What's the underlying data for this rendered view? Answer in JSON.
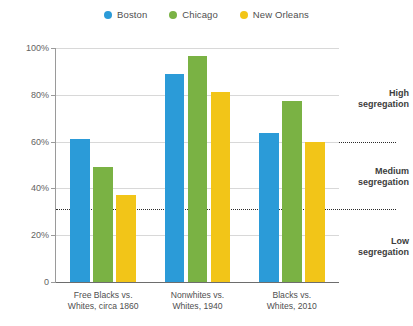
{
  "legend": {
    "position": "top-center",
    "items": [
      {
        "label": "Boston",
        "color": "#2b9bd8",
        "icon": "circle-marker-icon"
      },
      {
        "label": "Chicago",
        "color": "#7ab244",
        "icon": "circle-marker-icon"
      },
      {
        "label": "New Orleans",
        "color": "#f2c518",
        "icon": "circle-marker-icon"
      }
    ]
  },
  "axis": {
    "y_ticks": [
      "0",
      "20%",
      "40%",
      "60%",
      "80%",
      "100%"
    ],
    "y_tick_values": [
      0,
      20,
      40,
      60,
      80,
      100
    ]
  },
  "annotations": [
    {
      "name": "high-segregation",
      "text": "High\nsegregation",
      "at": 78
    },
    {
      "name": "medium-segregation",
      "text": "Medium\nsegregation",
      "at": 45
    },
    {
      "name": "low-segregation",
      "text": "Low\nsegregation",
      "at": 15
    }
  ],
  "thresholds": [
    {
      "name": "high-threshold",
      "value": 60
    },
    {
      "name": "low-threshold",
      "value": 31
    }
  ],
  "chart_data": {
    "type": "bar",
    "title": "",
    "xlabel": "",
    "ylabel": "",
    "ylim": [
      0,
      100
    ],
    "grid": true,
    "legend_position": "top-center",
    "categories": [
      "Free Blacks vs.\nWhites, circa 1860",
      "Nonwhites vs.\nWhites, 1940",
      "Blacks vs.\nWhites, 2010"
    ],
    "series": [
      {
        "name": "Boston",
        "color": "#2b9bd8",
        "values": [
          61,
          89,
          63.5
        ]
      },
      {
        "name": "Chicago",
        "color": "#7ab244",
        "values": [
          49,
          96.5,
          77.5
        ]
      },
      {
        "name": "New Orleans",
        "color": "#f2c518",
        "values": [
          37,
          81,
          60
        ]
      }
    ],
    "threshold_lines": [
      {
        "label": "High segregation",
        "value": 60
      },
      {
        "label": "Medium segregation",
        "value": 31
      }
    ]
  }
}
